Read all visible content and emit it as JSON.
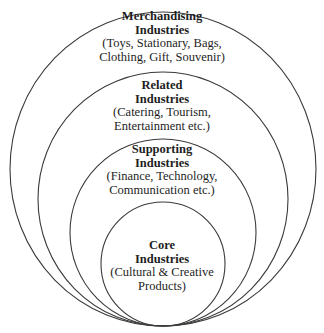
{
  "diagram": {
    "type": "nested-circles",
    "rings": [
      {
        "id": "merchandising",
        "title_line1": "Merchandising",
        "title_line2": "Industries",
        "desc_line1": "(Toys, Stationary, Bags,",
        "desc_line2": "Clothing, Gift, Souvenir)"
      },
      {
        "id": "related",
        "title_line1": "Related",
        "title_line2": "Industries",
        "desc_line1": "(Catering, Tourism,",
        "desc_line2": "Entertainment etc.)"
      },
      {
        "id": "supporting",
        "title_line1": "Supporting",
        "title_line2": "Industries",
        "desc_line1": "(Finance, Technology,",
        "desc_line2": "Communication etc.)"
      },
      {
        "id": "core",
        "title_line1": "Core",
        "title_line2": "Industries",
        "desc_line1": "(Cultural & Creative",
        "desc_line2": "Products)"
      }
    ],
    "colors": {
      "stroke": "#3a3a3a",
      "text": "#1e1e1e",
      "background": "#ffffff"
    }
  }
}
